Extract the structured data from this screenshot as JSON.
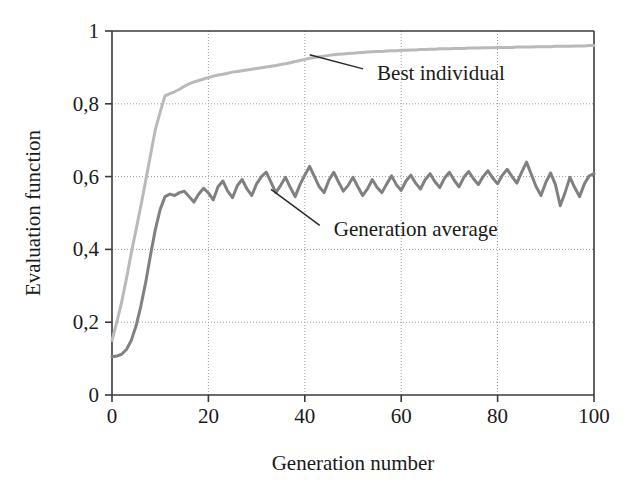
{
  "chart_data": {
    "type": "line",
    "title": "",
    "xlabel": "Generation number",
    "ylabel": "Evaluation function",
    "xlim": [
      0,
      100
    ],
    "ylim": [
      0,
      1
    ],
    "grid": true,
    "legend_position": "inline-annotations",
    "xticks": [
      0,
      20,
      40,
      60,
      80,
      100
    ],
    "xtick_labels": [
      "0",
      "20",
      "40",
      "60",
      "80",
      "100"
    ],
    "yticks": [
      0,
      0.2,
      0.4,
      0.6,
      0.8,
      1
    ],
    "ytick_labels": [
      "0",
      "0,2",
      "0,4",
      "0,6",
      "0,8",
      "1"
    ],
    "decimal_separator": ",",
    "x": [
      0,
      1,
      2,
      3,
      4,
      5,
      6,
      7,
      8,
      9,
      10,
      11,
      12,
      13,
      14,
      15,
      16,
      17,
      18,
      19,
      20,
      21,
      22,
      23,
      24,
      25,
      26,
      27,
      28,
      29,
      30,
      31,
      32,
      33,
      34,
      35,
      36,
      37,
      38,
      39,
      40,
      41,
      42,
      43,
      44,
      45,
      46,
      47,
      48,
      49,
      50,
      51,
      52,
      53,
      54,
      55,
      56,
      57,
      58,
      59,
      60,
      61,
      62,
      63,
      64,
      65,
      66,
      67,
      68,
      69,
      70,
      71,
      72,
      73,
      74,
      75,
      76,
      77,
      78,
      79,
      80,
      81,
      82,
      83,
      84,
      85,
      86,
      87,
      88,
      89,
      90,
      91,
      92,
      93,
      94,
      95,
      96,
      97,
      98,
      99,
      100
    ],
    "series": [
      {
        "name": "Best individual",
        "color": "#b9b9b9",
        "line_width": 3,
        "label_position": {
          "x": 55,
          "y": 0.885
        },
        "leader_from": {
          "x": 41,
          "y": 0.935
        },
        "values": [
          0.15,
          0.2,
          0.255,
          0.32,
          0.39,
          0.455,
          0.52,
          0.59,
          0.66,
          0.73,
          0.778,
          0.822,
          0.828,
          0.833,
          0.84,
          0.848,
          0.855,
          0.86,
          0.864,
          0.868,
          0.872,
          0.876,
          0.879,
          0.881,
          0.884,
          0.887,
          0.889,
          0.891,
          0.893,
          0.895,
          0.897,
          0.899,
          0.901,
          0.903,
          0.905,
          0.908,
          0.91,
          0.913,
          0.916,
          0.919,
          0.922,
          0.925,
          0.927,
          0.929,
          0.931,
          0.933,
          0.935,
          0.936,
          0.937,
          0.938,
          0.939,
          0.94,
          0.941,
          0.942,
          0.943,
          0.944,
          0.944,
          0.945,
          0.946,
          0.946,
          0.947,
          0.947,
          0.948,
          0.948,
          0.949,
          0.949,
          0.95,
          0.95,
          0.951,
          0.951,
          0.951,
          0.952,
          0.952,
          0.952,
          0.953,
          0.953,
          0.953,
          0.954,
          0.954,
          0.954,
          0.955,
          0.955,
          0.955,
          0.955,
          0.956,
          0.956,
          0.956,
          0.956,
          0.957,
          0.957,
          0.957,
          0.957,
          0.958,
          0.958,
          0.958,
          0.958,
          0.959,
          0.959,
          0.959,
          0.96,
          0.96
        ]
      },
      {
        "name": "Generation average",
        "color": "#808080",
        "line_width": 3,
        "label_position": {
          "x": 46,
          "y": 0.455
        },
        "leader_from": {
          "x": 33,
          "y": 0.565
        },
        "values": [
          0.105,
          0.107,
          0.112,
          0.125,
          0.15,
          0.19,
          0.245,
          0.31,
          0.385,
          0.455,
          0.51,
          0.545,
          0.552,
          0.548,
          0.556,
          0.56,
          0.545,
          0.53,
          0.552,
          0.568,
          0.555,
          0.536,
          0.572,
          0.588,
          0.56,
          0.542,
          0.575,
          0.592,
          0.566,
          0.548,
          0.58,
          0.6,
          0.612,
          0.584,
          0.556,
          0.576,
          0.598,
          0.57,
          0.545,
          0.578,
          0.604,
          0.628,
          0.6,
          0.572,
          0.556,
          0.59,
          0.612,
          0.585,
          0.56,
          0.576,
          0.598,
          0.572,
          0.548,
          0.566,
          0.592,
          0.57,
          0.556,
          0.58,
          0.602,
          0.578,
          0.562,
          0.588,
          0.604,
          0.582,
          0.566,
          0.592,
          0.608,
          0.586,
          0.57,
          0.596,
          0.612,
          0.59,
          0.572,
          0.598,
          0.614,
          0.594,
          0.578,
          0.6,
          0.616,
          0.596,
          0.58,
          0.604,
          0.62,
          0.6,
          0.582,
          0.612,
          0.64,
          0.606,
          0.572,
          0.548,
          0.584,
          0.61,
          0.578,
          0.52,
          0.556,
          0.598,
          0.57,
          0.545,
          0.58,
          0.602,
          0.608
        ]
      }
    ],
    "annotations": [
      {
        "text": "Best individual",
        "series": "Best individual"
      },
      {
        "text": "Generation average",
        "series": "Generation average"
      }
    ],
    "style": {
      "axis_color": "#3a3a3a",
      "grid_color": "#9a9a9a",
      "grid_dash": "1,2",
      "background": "#ffffff",
      "leader_color": "#2a2a2a"
    }
  }
}
